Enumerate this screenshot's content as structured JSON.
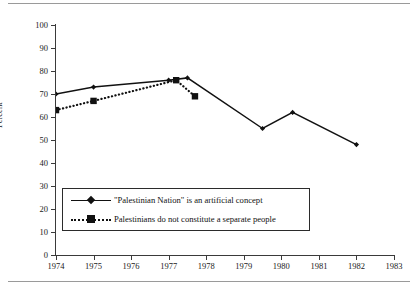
{
  "chart_data": {
    "type": "line",
    "title": "",
    "xlabel": "",
    "ylabel": "Percent",
    "xlim": [
      1974,
      1983
    ],
    "ylim": [
      0,
      100
    ],
    "grid": false,
    "legend_position": "inside-lower-left",
    "x_ticks": [
      "1974",
      "1975",
      "1976",
      "1977",
      "1978",
      "1979",
      "1980",
      "1981",
      "1982",
      "1983"
    ],
    "y_ticks": [
      "0",
      "10",
      "20",
      "30",
      "40",
      "50",
      "60",
      "70",
      "80",
      "90",
      "100"
    ],
    "series": [
      {
        "name": "\"Palestinian Nation\" is an artificial concept",
        "style": "solid",
        "marker": "diamond",
        "color": "#111111",
        "points": [
          {
            "x": 1974.0,
            "y": 70
          },
          {
            "x": 1975.0,
            "y": 73
          },
          {
            "x": 1977.0,
            "y": 76
          },
          {
            "x": 1977.5,
            "y": 77
          },
          {
            "x": 1979.5,
            "y": 55
          },
          {
            "x": 1980.3,
            "y": 62
          },
          {
            "x": 1982.0,
            "y": 48
          }
        ]
      },
      {
        "name": "Palestinians do not constitute a separate people",
        "style": "dotted",
        "marker": "square",
        "color": "#111111",
        "points": [
          {
            "x": 1974.0,
            "y": 63
          },
          {
            "x": 1975.0,
            "y": 67
          },
          {
            "x": 1977.2,
            "y": 76
          },
          {
            "x": 1977.7,
            "y": 69
          }
        ]
      }
    ]
  },
  "legend": {
    "items": [
      {
        "label": "\"Palestinian Nation\" is an artificial concept"
      },
      {
        "label": "Palestinians do not constitute a separate people"
      }
    ]
  },
  "axes": {
    "y_title": "Percent"
  }
}
